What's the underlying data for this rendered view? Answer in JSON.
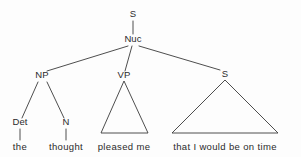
{
  "figure": {
    "name": "syntax-tree",
    "background_color": "#fdfdfd",
    "line_color": "#3a3a3a",
    "text_color": "#2b2b2b"
  },
  "nodes": {
    "root_s": {
      "label": "S",
      "x": 133,
      "y": 17
    },
    "nuc": {
      "label": "Nuc",
      "x": 133,
      "y": 42
    },
    "np": {
      "label": "NP",
      "x": 42,
      "y": 78
    },
    "vp": {
      "label": "VP",
      "x": 124,
      "y": 78
    },
    "embedded_s": {
      "label": "S",
      "x": 225,
      "y": 77
    },
    "det": {
      "label": "Det",
      "x": 20,
      "y": 125
    },
    "n": {
      "label": "N",
      "x": 66,
      "y": 125
    }
  },
  "leaves": {
    "the": {
      "label": "the",
      "x": 20,
      "y": 150
    },
    "thought": {
      "label": "thought",
      "x": 66,
      "y": 150
    },
    "pleased_me": {
      "label": "pleased me",
      "x": 124,
      "y": 150
    },
    "that_clause": {
      "label": "that I would be on time",
      "x": 225,
      "y": 150
    }
  },
  "edges": [
    {
      "name": "edge-root-s-to-nuc",
      "x1": 133,
      "y1": 21,
      "x2": 133,
      "y2": 34
    },
    {
      "name": "edge-nuc-to-np",
      "x1": 128,
      "y1": 46,
      "x2": 47,
      "y2": 71
    },
    {
      "name": "edge-nuc-to-vp",
      "x1": 132,
      "y1": 46,
      "x2": 125,
      "y2": 71
    },
    {
      "name": "edge-nuc-to-embedded-s",
      "x1": 139,
      "y1": 46,
      "x2": 220,
      "y2": 70
    },
    {
      "name": "edge-np-to-det",
      "x1": 38,
      "y1": 82,
      "x2": 22,
      "y2": 118
    },
    {
      "name": "edge-np-to-n",
      "x1": 47,
      "y1": 82,
      "x2": 64,
      "y2": 118
    },
    {
      "name": "edge-det-to-the",
      "x1": 20,
      "y1": 129,
      "x2": 20,
      "y2": 140
    },
    {
      "name": "edge-n-to-thought",
      "x1": 66,
      "y1": 129,
      "x2": 66,
      "y2": 140
    }
  ],
  "triangles": [
    {
      "name": "triangle-vp-pleased-me",
      "apex_x": 124,
      "apex_y": 81,
      "left_x": 101,
      "right_x": 148,
      "base_y": 133
    },
    {
      "name": "triangle-s-that-clause",
      "apex_x": 225,
      "apex_y": 80,
      "left_x": 172,
      "right_x": 278,
      "base_y": 133
    }
  ]
}
